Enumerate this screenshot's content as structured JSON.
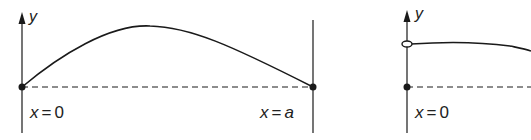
{
  "figure": {
    "colors": {
      "ink": "#1a1a1a",
      "background": "#ffffff"
    },
    "left_panel": {
      "axis_label": "y",
      "left_boundary_label_var": "x",
      "left_boundary_label_eq": "=",
      "left_boundary_label_val": "0",
      "right_boundary_label_var": "x",
      "right_boundary_label_eq": "=",
      "right_boundary_label_val": "a",
      "curve": "arch from fixed point at x=0 up to a maximum and down to fixed point at x=a",
      "endpoints": [
        "filled-dot",
        "filled-dot"
      ]
    },
    "right_panel": {
      "axis_label": "y",
      "left_boundary_label_var": "x",
      "left_boundary_label_eq": "=",
      "left_boundary_label_val": "0",
      "curve": "starts at an open ring (free end) above the baseline and stays nearly flat, then slopes down",
      "markers": [
        "open-ring",
        "filled-dot"
      ]
    }
  }
}
